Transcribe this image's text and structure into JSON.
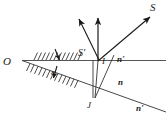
{
  "figure": {
    "background_color": "#ffffff",
    "stroke_color": "#1a1a1a",
    "labels": {
      "origin": "O",
      "source_ray": "S",
      "secondary_ray": "S'",
      "point_i": "I",
      "point_j": "J",
      "index_upper": "n'",
      "index_middle": "n",
      "index_lower": "n'",
      "angle_epsilon": "ε"
    },
    "icons": {
      "arrowhead": "arrowhead-icon",
      "hatching": "hatch-marks-icon",
      "angle_marker": "angle-tick-icon"
    },
    "geometry": {
      "origin_point": [
        22,
        60
      ],
      "point_i": [
        98,
        60
      ],
      "point_j": [
        95,
        98
      ],
      "horizontal_line_end": [
        166,
        60
      ],
      "slanted_line_end": [
        166,
        112
      ],
      "hatch_upper_span": [
        33,
        80
      ],
      "hatch_lower_span": [
        28,
        80
      ]
    },
    "rays": [
      {
        "name": "incident-ray-S",
        "from": [
          98,
          60
        ],
        "to": [
          152,
          14
        ],
        "arrow": true
      },
      {
        "name": "vertical-normal-at-i",
        "from": [
          98,
          60
        ],
        "to": [
          98,
          16
        ],
        "arrow": true
      },
      {
        "name": "reflected-ray-left",
        "from": [
          98,
          60
        ],
        "to": [
          78,
          18
        ],
        "arrow": true
      },
      {
        "name": "internal-ray-j-to-i",
        "from": [
          95,
          98
        ],
        "to": [
          98,
          60
        ],
        "arrow": false
      },
      {
        "name": "internal-ray-j-upper",
        "from": [
          95,
          98
        ],
        "to": [
          112,
          60
        ],
        "arrow": false
      },
      {
        "name": "vertical-normal-at-j",
        "from": [
          95,
          98
        ],
        "to": [
          95,
          60
        ],
        "arrow": false
      }
    ]
  }
}
